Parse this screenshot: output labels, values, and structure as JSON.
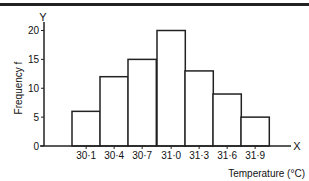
{
  "chart_data": {
    "type": "bar",
    "subtype": "histogram",
    "title": "",
    "xlabel": "Temperature (°C)",
    "ylabel": "Frequency f",
    "x_axis_letter": "X",
    "y_axis_letter": "Y",
    "categories": [
      "30·1",
      "30·4",
      "30·7",
      "31·0",
      "31·3",
      "31·6",
      "31·9"
    ],
    "values": [
      6,
      12,
      15,
      20,
      13,
      9,
      5
    ],
    "ylim": [
      0,
      20
    ],
    "yticks": [
      0,
      5,
      10,
      15,
      20
    ],
    "grid": false,
    "legend": null
  },
  "labels": {
    "ylabel": "Frequency f",
    "xlabel": "Temperature (°C)",
    "x_letter": "X",
    "y_letter": "Y",
    "yticks": [
      "0",
      "5",
      "10",
      "15",
      "20"
    ],
    "xticks": [
      "30·1",
      "30·4",
      "30·7",
      "31·0",
      "31·3",
      "31·6",
      "31·9"
    ]
  }
}
